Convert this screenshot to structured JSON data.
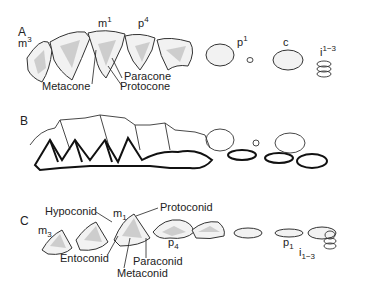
{
  "panels": [
    {
      "id": "A",
      "letter": "A",
      "tooth_labels": {
        "m3": "m",
        "m3_sup": "3",
        "m1": "m",
        "m1_sup": "1",
        "p4": "p",
        "p4_sup": "4",
        "p1": "p",
        "p1_sup": "1",
        "c": "c",
        "i": "i",
        "i_sup": "1−3"
      },
      "cusp_labels": [
        "Metacone",
        "Paracone",
        "Protocone"
      ]
    },
    {
      "id": "B",
      "letter": "B"
    },
    {
      "id": "C",
      "letter": "C",
      "tooth_labels": {
        "m3": "m",
        "m3_sub": "3",
        "m1": "m",
        "m1_sub": "1",
        "p4": "p",
        "p4_sub": "4",
        "p1": "p",
        "p1_sub": "1",
        "i": "i",
        "i_sub": "1−3"
      },
      "cusp_labels": [
        "Hypoconid",
        "Protoconid",
        "Entoconid",
        "Paraconid",
        "Metaconid"
      ]
    }
  ]
}
